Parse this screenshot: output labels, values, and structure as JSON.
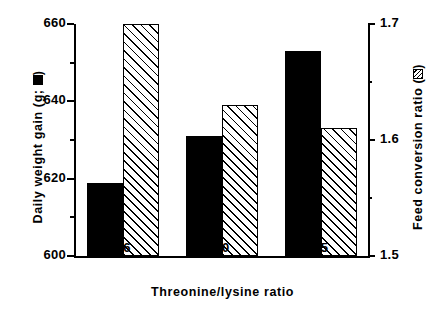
{
  "chart_data": {
    "type": "bar",
    "title": "",
    "subtitle": "",
    "xlabel": "Threonine/lysine ratio",
    "categories": [
      "56",
      "60",
      "65"
    ],
    "grid": false,
    "legend_position": "axis-labels",
    "series": [
      {
        "name": "Daily weight gain (g)",
        "axis": "left",
        "marker": "filled-black-square",
        "color": "#000000",
        "values": [
          619,
          631,
          653
        ]
      },
      {
        "name": "Feed conversion ratio",
        "axis": "right",
        "marker": "hatched-square",
        "color": "#ffffff",
        "values": [
          1.7,
          1.63,
          1.61
        ]
      }
    ],
    "left_axis": {
      "label_prefix": "Daily weight gain (g; ",
      "label_suffix": ")",
      "ylim": [
        600,
        660
      ],
      "ticks": [
        "600",
        "620",
        "640",
        "660"
      ],
      "tick_values": [
        600,
        620,
        640,
        660
      ],
      "minor_tick_values": [
        610,
        630,
        650
      ]
    },
    "right_axis": {
      "label_prefix": "Feed conversion ratio (",
      "label_suffix": ")",
      "ylim": [
        1.5,
        1.7
      ],
      "ticks": [
        "1.5",
        "1.6",
        "1.7"
      ],
      "tick_values": [
        1.5,
        1.6,
        1.7
      ],
      "minor_tick_values": [
        1.55,
        1.65
      ]
    }
  }
}
